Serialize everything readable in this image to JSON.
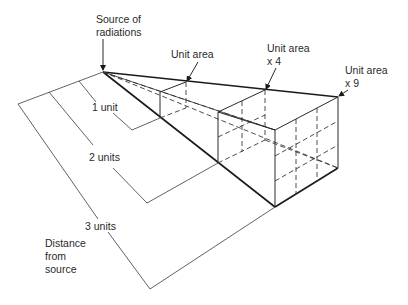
{
  "diagram": {
    "labels": {
      "source": [
        "Source of",
        "radiations"
      ],
      "unit_area_1": [
        "Unit area"
      ],
      "unit_area_4": [
        "Unit area",
        "x 4"
      ],
      "unit_area_9": [
        "Unit area",
        "x 9"
      ],
      "dist_1": "1 unit",
      "dist_2": "2 units",
      "dist_3": "3 units",
      "distance_caption": [
        "Distance",
        "from",
        "source"
      ]
    },
    "colors": {
      "line": "#2a2a2a",
      "background": "#ffffff"
    }
  }
}
